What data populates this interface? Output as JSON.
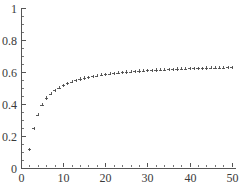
{
  "chart_data": {
    "type": "scatter",
    "title": "",
    "subtitle": "",
    "xlabel": "",
    "ylabel": "",
    "xlim": [
      0,
      51
    ],
    "ylim": [
      0,
      1
    ],
    "grid": false,
    "legend": null,
    "marker_style": "plus",
    "marker_color": "#4a4a4a",
    "axis_color": "#555555",
    "background_color": "#ffffff",
    "x_ticks": [
      0,
      10,
      20,
      30,
      40,
      50
    ],
    "x_tick_labels": [
      "0",
      "10",
      "20",
      "30",
      "40",
      "50"
    ],
    "x_minor_tick_step": 2,
    "y_ticks": [
      0,
      0.2,
      0.4,
      0.6,
      0.8,
      1
    ],
    "y_tick_labels": [
      "0",
      "0.2",
      "0.4",
      "0.6",
      "0.8",
      "1"
    ],
    "y_minor_tick_step": 0.05,
    "series": [
      {
        "name": "series-1",
        "x": [
          2,
          3,
          4,
          5,
          6,
          7,
          8,
          9,
          10,
          11,
          12,
          13,
          14,
          15,
          16,
          17,
          18,
          19,
          20,
          21,
          22,
          23,
          24,
          25,
          26,
          27,
          28,
          29,
          30,
          31,
          32,
          33,
          34,
          35,
          36,
          37,
          38,
          39,
          40,
          41,
          42,
          43,
          44,
          45,
          46,
          47,
          48,
          49,
          50
        ],
        "y": [
          0.118,
          0.249,
          0.333,
          0.396,
          0.437,
          0.464,
          0.486,
          0.503,
          0.517,
          0.529,
          0.539,
          0.548,
          0.556,
          0.562,
          0.568,
          0.573,
          0.578,
          0.582,
          0.586,
          0.589,
          0.592,
          0.595,
          0.598,
          0.6,
          0.602,
          0.604,
          0.606,
          0.608,
          0.61,
          0.611,
          0.613,
          0.614,
          0.615,
          0.617,
          0.618,
          0.619,
          0.62,
          0.621,
          0.622,
          0.623,
          0.624,
          0.624,
          0.625,
          0.626,
          0.627,
          0.627,
          0.628,
          0.629,
          0.629
        ]
      }
    ]
  },
  "geometry": {
    "width": 241,
    "height": 184,
    "plot_left": 21,
    "plot_right": 236,
    "plot_top": 8,
    "plot_bottom": 168
  }
}
